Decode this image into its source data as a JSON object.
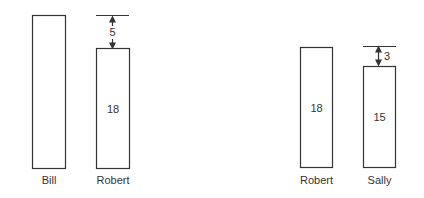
{
  "diagram": {
    "left_group": {
      "bars": [
        {
          "name": "Bill",
          "label": "Bill",
          "value_label": ""
        },
        {
          "name": "Robert",
          "label": "Robert",
          "value_label": "18"
        }
      ],
      "difference_label": "5"
    },
    "right_group": {
      "bars": [
        {
          "name": "Robert",
          "label": "Robert",
          "value_label": "18"
        },
        {
          "name": "Sally",
          "label": "Sally",
          "value_label": "15"
        }
      ],
      "difference_label": "3"
    }
  }
}
